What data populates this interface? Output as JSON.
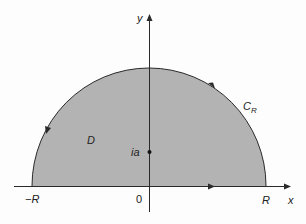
{
  "diagram": {
    "colors": {
      "region_fill": "#b3b3b3",
      "stroke": "#2a2a2a",
      "background": "#fdfdfd"
    },
    "axes": {
      "x_label": "x",
      "y_label": "y",
      "origin_label": "0"
    },
    "points": {
      "left_endpoint": "−R",
      "right_endpoint": "R",
      "interior_point": "ia"
    },
    "region_label": "D",
    "contour": {
      "label_main": "C",
      "label_sub": "R",
      "orientation": "counterclockwise"
    }
  }
}
